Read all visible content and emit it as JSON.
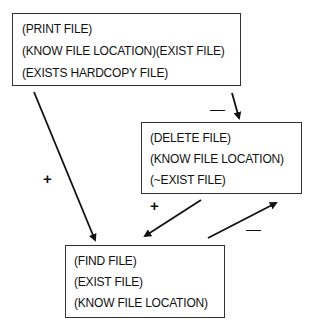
{
  "diagram": {
    "nodes": [
      {
        "id": "print",
        "lines": [
          "(PRINT FILE)",
          "(KNOW FILE LOCATION)(EXIST FILE)",
          "(EXISTS HARDCOPY FILE)"
        ]
      },
      {
        "id": "delete",
        "lines": [
          "(DELETE FILE)",
          "(KNOW FILE LOCATION)",
          "(~EXIST FILE)"
        ]
      },
      {
        "id": "find",
        "lines": [
          "(FIND FILE)",
          "(EXIST FILE)",
          "(KNOW FILE LOCATION)"
        ]
      }
    ],
    "edges": [
      {
        "from": "print",
        "to": "find",
        "sign": "+"
      },
      {
        "from": "print",
        "to": "delete",
        "sign": "—"
      },
      {
        "from": "delete",
        "to": "find",
        "sign": "+"
      },
      {
        "from": "find",
        "to": "delete",
        "sign": "—"
      }
    ]
  }
}
